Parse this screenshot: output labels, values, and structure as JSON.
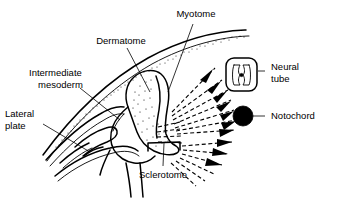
{
  "figure": {
    "background_color": "#ffffff",
    "line_color": "#000000",
    "width": 341,
    "height": 201
  },
  "labels": {
    "myotome": "Myotome",
    "dermatome": "Dermatome",
    "intermediate_mesoderm_line1": "Intermediate",
    "intermediate_mesoderm_line2": "mesoderm",
    "lateral_plate_line1": "Lateral",
    "lateral_plate_line2": "plate",
    "sclerotome": "Sclerotome",
    "neural_tube_line1": "Neural",
    "neural_tube_line2": "tube",
    "notochord": "Notochord"
  },
  "structures": {
    "ectoderm": "ectoderm-band",
    "somite": "somite-body",
    "neural_tube": "neural-tube-icon",
    "notochord": "notochord-dot",
    "sclerotome_bracket": "sclerotome-bracket",
    "migration_arrows": "sclerotome-migration-arrows",
    "lateral_plate": "lateral-plate-cavity"
  }
}
